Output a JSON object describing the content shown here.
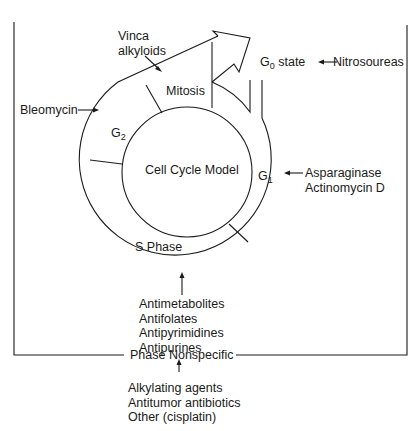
{
  "diagram": {
    "title": "Cell Cycle Model",
    "phases": {
      "mitosis": "Mitosis",
      "g2_main": "G",
      "g2_sub": "2",
      "g1_main": "G",
      "g1_sub": "1",
      "s_phase": "S Phase",
      "g0_main": "G",
      "g0_sub": "0",
      "g0_suffix": " state"
    },
    "agents": {
      "vinca": [
        "Vinca",
        "alkyloids"
      ],
      "bleomycin": "Bleomycin",
      "nitrosoureas": "Nitrosoureas",
      "g1_agents": [
        "Asparaginase",
        "Actinomycin D"
      ],
      "s_phase_agents": [
        "Antimetabolites",
        "Antifolates",
        "Antipyrimidines",
        "Antipurines"
      ],
      "phase_nonspecific_label": "Phase Nonspecific",
      "nonspecific_agents": [
        "Alkylating agents",
        "Antitumor antibiotics",
        "Other (cisplatin)"
      ]
    },
    "colors": {
      "line": "#1a1a1a",
      "background": "#ffffff"
    }
  }
}
